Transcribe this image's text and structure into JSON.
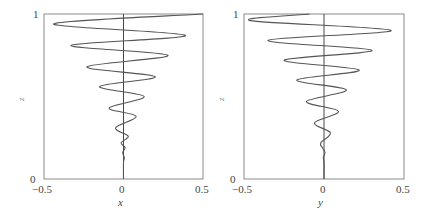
{
  "chart_data": [
    {
      "type": "line",
      "title": "",
      "xlabel": "x",
      "ylabel": "z",
      "xlim": [
        -0.5,
        0.5
      ],
      "ylim": [
        0,
        1
      ],
      "x_ticks": [
        "-0.5",
        "0",
        "0.5"
      ],
      "y_ticks": [
        "0",
        "1"
      ],
      "grid": false,
      "zero_line": true,
      "series": [
        {
          "name": "x(z)",
          "points": [
            {
              "x": 0.0,
              "z": 0.0
            },
            {
              "x": 0.0,
              "z": 0.1
            },
            {
              "x": 0.005,
              "z": 0.13
            },
            {
              "x": -0.005,
              "z": 0.16
            },
            {
              "x": 0.01,
              "z": 0.19
            },
            {
              "x": -0.015,
              "z": 0.22
            },
            {
              "x": 0.03,
              "z": 0.26
            },
            {
              "x": -0.05,
              "z": 0.31
            },
            {
              "x": 0.08,
              "z": 0.38
            },
            {
              "x": -0.09,
              "z": 0.43
            },
            {
              "x": 0.13,
              "z": 0.5
            },
            {
              "x": -0.15,
              "z": 0.56
            },
            {
              "x": 0.2,
              "z": 0.62
            },
            {
              "x": -0.23,
              "z": 0.68
            },
            {
              "x": 0.28,
              "z": 0.75
            },
            {
              "x": -0.33,
              "z": 0.81
            },
            {
              "x": 0.39,
              "z": 0.87
            },
            {
              "x": -0.44,
              "z": 0.94
            },
            {
              "x": 0.5,
              "z": 1.0
            }
          ]
        }
      ]
    },
    {
      "type": "line",
      "title": "",
      "xlabel": "y",
      "ylabel": "z",
      "xlim": [
        -0.5,
        0.5
      ],
      "ylim": [
        0,
        1
      ],
      "x_ticks": [
        "-0.5",
        "0",
        "0.5"
      ],
      "y_ticks": [
        "0",
        "1"
      ],
      "grid": false,
      "zero_line": true,
      "series": [
        {
          "name": "y(z)",
          "points": [
            {
              "y": 0.0,
              "z": 0.0
            },
            {
              "y": 0.0,
              "z": 0.1
            },
            {
              "y": -0.004,
              "z": 0.13
            },
            {
              "y": 0.006,
              "z": 0.16
            },
            {
              "y": -0.01,
              "z": 0.19
            },
            {
              "y": -0.02,
              "z": 0.22
            },
            {
              "y": 0.04,
              "z": 0.28
            },
            {
              "y": -0.06,
              "z": 0.34
            },
            {
              "y": 0.09,
              "z": 0.41
            },
            {
              "y": -0.11,
              "z": 0.47
            },
            {
              "y": 0.14,
              "z": 0.54
            },
            {
              "y": -0.17,
              "z": 0.6
            },
            {
              "y": 0.22,
              "z": 0.66
            },
            {
              "y": -0.25,
              "z": 0.72
            },
            {
              "y": 0.3,
              "z": 0.78
            },
            {
              "y": -0.35,
              "z": 0.84
            },
            {
              "y": 0.42,
              "z": 0.9
            },
            {
              "y": -0.46,
              "z": 0.96
            },
            {
              "y": -0.09,
              "z": 1.0
            }
          ]
        }
      ]
    }
  ],
  "panels": [
    {
      "xlabel": "x",
      "ylabel": "z",
      "tick_left": "−0.5",
      "tick_mid": "0",
      "tick_right": "0.5",
      "tick_bottom": "0",
      "tick_top": "1"
    },
    {
      "xlabel": "y",
      "ylabel": "z",
      "tick_left": "−0.5",
      "tick_mid": "0",
      "tick_right": "0.5",
      "tick_bottom": "0",
      "tick_top": "1"
    }
  ],
  "colors": {
    "curve": "#555555",
    "axis": "#777777",
    "zero_line": "#333333"
  }
}
